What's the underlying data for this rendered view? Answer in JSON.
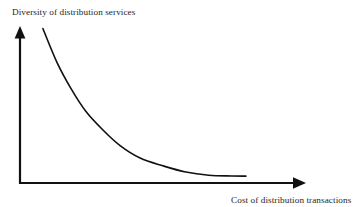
{
  "chart_data": {
    "type": "line",
    "title": "",
    "subtitle": "",
    "xlabel": "Cost of distribution transactions",
    "ylabel": "Diversity of distribution services",
    "xlabel_position": "bottom-right",
    "ylabel_position": "top-left",
    "grid": false,
    "legend": null,
    "axis_style": "arrow-headed open axes",
    "tick_labels": {
      "x": [],
      "y": []
    },
    "xlim": [
      0,
      1
    ],
    "ylim": [
      0,
      1
    ],
    "annotations": [],
    "series": [
      {
        "name": "Diversity vs cost",
        "shape": "decreasing convex (exponential decay toward asymptote)",
        "color": "#111111",
        "linewidth": 1.6,
        "x": [
          0.08,
          0.13,
          0.18,
          0.23,
          0.29,
          0.35,
          0.42,
          0.5,
          0.58,
          0.66,
          0.74,
          0.79
        ],
        "y": [
          0.99,
          0.77,
          0.6,
          0.46,
          0.34,
          0.24,
          0.16,
          0.11,
          0.07,
          0.05,
          0.045,
          0.044
        ]
      }
    ]
  },
  "figure": {
    "background_color": "#ffffff",
    "axis_color": "#111111",
    "text_color": "#262626",
    "curve_color": "#111111"
  },
  "labels": {
    "y_axis": "Diversity of distribution services",
    "x_axis": "Cost of distribution transactions"
  },
  "icons": {
    "y_arrow": "arrow-up-icon",
    "x_arrow": "arrow-right-icon"
  }
}
